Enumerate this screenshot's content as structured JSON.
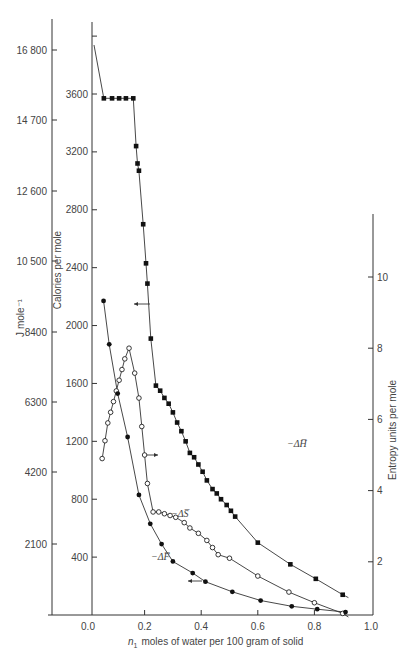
{
  "chart_data": {
    "type": "scatter",
    "title": "",
    "xlabel": "n1 moles of water per 100 gram of solid",
    "xlabel_sub": "1",
    "x_ticks": [
      "0.0",
      "0.2",
      "0.4",
      "0.6",
      "0.8",
      "1.0"
    ],
    "xlim": [
      -0.15,
      1.0
    ],
    "axes": {
      "joules": {
        "label": "J mole⁻¹",
        "ticks": [
          "2100",
          "4200",
          "6300",
          "8400",
          "10 500",
          "12 600",
          "14 700",
          "16 800"
        ],
        "tick_values": [
          2100,
          4200,
          6300,
          8400,
          10500,
          12600,
          14700,
          16800
        ]
      },
      "calories": {
        "label": "Calories per mole",
        "ticks": [
          "400",
          "800",
          "1200",
          "1600",
          "2000",
          "2400",
          "2800",
          "3200",
          "3600"
        ],
        "tick_values": [
          400,
          800,
          1200,
          1600,
          2000,
          2400,
          2800,
          3200,
          3600,
          4000
        ],
        "ylim": [
          0,
          4100
        ]
      },
      "entropy": {
        "label": "Entropy units per mole",
        "ticks": [
          "2",
          "4",
          "6",
          "8",
          "10"
        ],
        "tick_values": [
          2,
          4,
          6,
          8,
          10
        ],
        "ylim": [
          0,
          11
        ]
      }
    },
    "series": [
      {
        "name": "-ΔH̅",
        "label": "−ΔH̅",
        "axis": "calories",
        "marker": "filled-square",
        "x": [
          0.056,
          0.085,
          0.11,
          0.134,
          0.16,
          0.17,
          0.175,
          0.18,
          0.195,
          0.205,
          0.21,
          0.222,
          0.24,
          0.255,
          0.27,
          0.285,
          0.3,
          0.315,
          0.33,
          0.345,
          0.36,
          0.375,
          0.39,
          0.405,
          0.42,
          0.44,
          0.455,
          0.47,
          0.49,
          0.505,
          0.52,
          0.6,
          0.715,
          0.805,
          0.9
        ],
        "y": [
          3570,
          3570,
          3570,
          3570,
          3570,
          3240,
          3120,
          3070,
          2700,
          2430,
          2290,
          1910,
          1585,
          1550,
          1500,
          1460,
          1400,
          1330,
          1270,
          1200,
          1120,
          1090,
          1040,
          990,
          930,
          870,
          840,
          800,
          760,
          720,
          680,
          500,
          350,
          250,
          140
        ]
      },
      {
        "name": "-ΔS̅",
        "label": "−ΔS̅",
        "axis": "entropy",
        "marker": "open-circle",
        "x": [
          0.05,
          0.06,
          0.07,
          0.08,
          0.09,
          0.1,
          0.11,
          0.12,
          0.13,
          0.145,
          0.165,
          0.18,
          0.19,
          0.2,
          0.21,
          0.23,
          0.25,
          0.27,
          0.29,
          0.31,
          0.34,
          0.36,
          0.39,
          0.42,
          0.44,
          0.46,
          0.5,
          0.6,
          0.71,
          0.8,
          0.9
        ],
        "y": [
          4.9,
          5.4,
          5.9,
          6.2,
          6.5,
          6.8,
          7.1,
          7.4,
          7.7,
          8.0,
          7.3,
          6.6,
          5.8,
          5.0,
          4.2,
          3.4,
          3.4,
          3.35,
          3.3,
          3.25,
          3.1,
          2.95,
          2.8,
          2.6,
          2.4,
          2.2,
          2.1,
          1.6,
          1.15,
          0.85,
          0.55
        ]
      },
      {
        "name": "-ΔF̅",
        "label": "−ΔF̅",
        "axis": "calories",
        "marker": "filled-circle",
        "x": [
          0.055,
          0.075,
          0.105,
          0.14,
          0.18,
          0.22,
          0.26,
          0.3,
          0.37,
          0.415,
          0.51,
          0.61,
          0.72,
          0.81,
          0.91
        ],
        "y": [
          2170,
          1870,
          1530,
          1230,
          830,
          630,
          490,
          370,
          290,
          230,
          160,
          100,
          60,
          40,
          20
        ]
      }
    ],
    "annotations": [
      {
        "text": "←",
        "near": "-ΔH̅",
        "meaning": "read on calories (left) axis"
      },
      {
        "text": "→",
        "near": "-ΔS̅",
        "meaning": "read on entropy (right) axis"
      },
      {
        "text": "←",
        "near": "-ΔF̅",
        "meaning": "read on calories (left) axis"
      }
    ],
    "grid": false,
    "legend": "none (inline curve labels)"
  },
  "labels": {
    "dH": "−ΔH̅",
    "dS": "−ΔS̅",
    "dF": "−ΔF̅",
    "x_axis_title_main": "moles of water per 100 gram of solid",
    "x_axis_n": "n",
    "x_axis_sub": "1",
    "j_axis_title": "J mole⁻¹",
    "cal_axis_title": "Calories per mole",
    "entropy_axis_title": "Entropy units per mole"
  }
}
